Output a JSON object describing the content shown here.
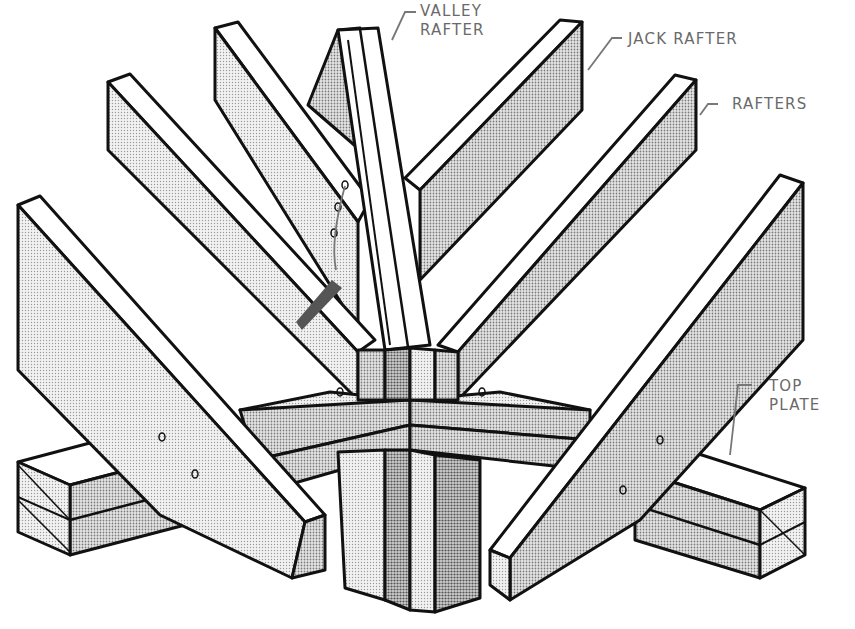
{
  "diagram": {
    "type": "isometric-technical-illustration",
    "colors": {
      "stroke": "#111111",
      "face_light": "#f4f4f4",
      "face_mid": "#cfcfcf",
      "face_dark": "#a9a9a9",
      "label": "#6a6a6a",
      "leader": "#777777"
    }
  },
  "labels": {
    "valley_rafter": {
      "line1": "VALLEY",
      "line2": "RAFTER"
    },
    "jack_rafter": {
      "line1": "JACK RAFTER"
    },
    "rafters": {
      "line1": "RAFTERS"
    },
    "top_plate": {
      "line1": "TOP",
      "line2": "PLATE"
    }
  }
}
